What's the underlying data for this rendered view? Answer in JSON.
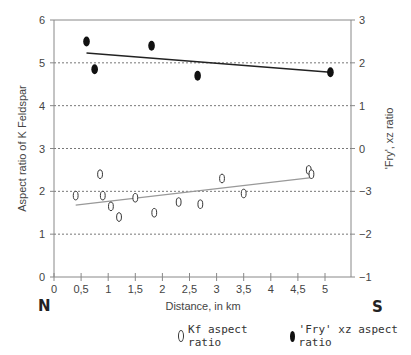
{
  "chart_data": {
    "type": "scatter",
    "title": "",
    "xlabel": "Distance, in km",
    "ylabel_left": "Aspect ratio of K Feldspar",
    "ylabel_right": "'Fry', xz ratio",
    "x_ticks": [
      "0",
      "0,5",
      "1",
      "1,5",
      "2",
      "2,5",
      "3",
      "3,5",
      "4",
      "4,5",
      "5"
    ],
    "x_tick_values": [
      0,
      0.5,
      1,
      1.5,
      2,
      2.5,
      3,
      3.5,
      4,
      4.5,
      5
    ],
    "y_left_ticks": [
      "0",
      "1",
      "2",
      "3",
      "4",
      "5",
      "6"
    ],
    "y_right_ticks": [
      "3",
      "2",
      "1",
      "0",
      "−3",
      "−2",
      "−1"
    ],
    "xlim": [
      0,
      5.5
    ],
    "ylim": [
      0,
      6
    ],
    "grid": "horizontal dotted",
    "direction_labels": {
      "left": "N",
      "right": "S"
    },
    "series": [
      {
        "name": "Kf aspect ratio",
        "marker": "open",
        "points": [
          [
            0.4,
            1.9
          ],
          [
            0.85,
            2.4
          ],
          [
            0.9,
            1.9
          ],
          [
            1.05,
            1.65
          ],
          [
            1.2,
            1.4
          ],
          [
            1.5,
            1.85
          ],
          [
            1.85,
            1.5
          ],
          [
            2.3,
            1.75
          ],
          [
            2.7,
            1.7
          ],
          [
            3.1,
            2.3
          ],
          [
            3.5,
            1.95
          ],
          [
            4.7,
            2.5
          ],
          [
            4.75,
            2.4
          ]
        ],
        "trendline": {
          "x": [
            0.4,
            4.75
          ],
          "y": [
            1.68,
            2.32
          ],
          "color": "#999999"
        }
      },
      {
        "name": "'Fry' xz aspect ratio",
        "marker": "filled",
        "points": [
          [
            0.6,
            5.5
          ],
          [
            0.75,
            4.85
          ],
          [
            1.8,
            5.4
          ],
          [
            2.65,
            4.7
          ],
          [
            5.1,
            4.78
          ]
        ],
        "trendline": {
          "x": [
            0.6,
            5.1
          ],
          "y": [
            5.23,
            4.78
          ],
          "color": "#222222"
        }
      }
    ],
    "legend": [
      {
        "label": "Kf aspect ratio",
        "marker": "open"
      },
      {
        "label": "'Fry' xz aspect ratio",
        "marker": "filled"
      }
    ]
  }
}
